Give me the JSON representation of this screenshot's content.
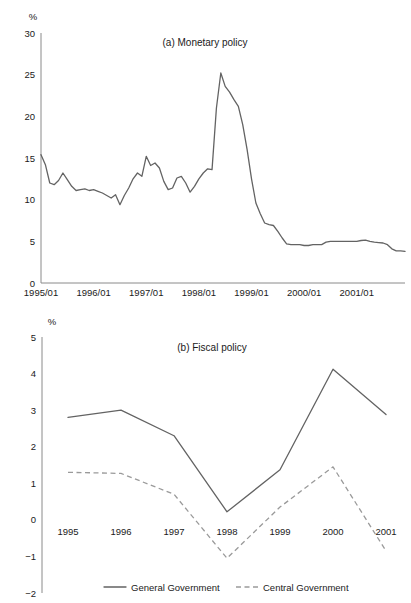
{
  "figure": {
    "unit_label": "%"
  },
  "chart_data": [
    {
      "type": "line",
      "panel_id": "a",
      "title": "(a) Monetary policy",
      "xlabel": "",
      "ylabel": "%",
      "ylim": [
        0,
        30
      ],
      "yticks": [
        0,
        5,
        10,
        15,
        20,
        25,
        30
      ],
      "ytick_labels": [
        "0",
        "5",
        "10",
        "15",
        "20",
        "25",
        "30"
      ],
      "xtick_labels": [
        "1995/01",
        "1996/01",
        "1997/01",
        "1998/01",
        "1999/01",
        "2000/01",
        "2001/01"
      ],
      "xtick_positions": [
        0,
        12,
        24,
        36,
        48,
        60,
        72
      ],
      "xlim": [
        0,
        83
      ],
      "grid": false,
      "legend": "none",
      "series": [
        {
          "name": "Interest rate",
          "style": "solid",
          "color": "#636363",
          "x": [
            0,
            1,
            2,
            3,
            4,
            5,
            6,
            7,
            8,
            9,
            10,
            11,
            12,
            13,
            14,
            15,
            16,
            17,
            18,
            19,
            20,
            21,
            22,
            23,
            24,
            25,
            26,
            27,
            28,
            29,
            30,
            31,
            32,
            33,
            34,
            35,
            36,
            37,
            38,
            39,
            40,
            41,
            42,
            43,
            44,
            45,
            46,
            47,
            48,
            49,
            50,
            51,
            52,
            53,
            54,
            55,
            56,
            57,
            58,
            59,
            60,
            61,
            62,
            63,
            64,
            65,
            66,
            67,
            68,
            69,
            70,
            71,
            72,
            73,
            74,
            75,
            76,
            77,
            78,
            79,
            80,
            81,
            82,
            83
          ],
          "values": [
            15.4,
            14.2,
            12.0,
            11.8,
            12.3,
            13.2,
            12.4,
            11.6,
            11.1,
            11.2,
            11.3,
            11.1,
            11.2,
            11.0,
            10.8,
            10.5,
            10.2,
            10.6,
            9.4,
            10.5,
            11.4,
            12.5,
            13.2,
            12.8,
            15.2,
            14.1,
            14.4,
            13.8,
            12.2,
            11.2,
            11.4,
            12.6,
            12.8,
            12.0,
            10.9,
            11.6,
            12.5,
            13.2,
            13.7,
            13.6,
            21.0,
            25.2,
            23.6,
            22.9,
            22.0,
            21.2,
            19.0,
            16.0,
            12.5,
            9.6,
            8.3,
            7.2,
            7.0,
            6.9,
            6.2,
            5.4,
            4.7,
            4.6,
            4.6,
            4.6,
            4.5,
            4.5,
            4.6,
            4.6,
            4.6,
            4.9,
            5.0,
            5.0,
            5.0,
            5.0,
            5.0,
            5.0,
            5.0,
            5.1,
            5.15,
            5.0,
            4.9,
            4.85,
            4.8,
            4.6,
            4.1,
            3.85,
            3.85,
            3.8
          ]
        }
      ]
    },
    {
      "type": "line",
      "panel_id": "b",
      "title": "(b) Fiscal policy",
      "xlabel": "",
      "ylabel": "%",
      "ylim": [
        -2,
        5
      ],
      "yticks": [
        -2,
        -1,
        0,
        1,
        2,
        3,
        4,
        5
      ],
      "ytick_labels": [
        "−2",
        "−1",
        "0",
        "1",
        "2",
        "3",
        "4",
        "5"
      ],
      "xtick_labels": [
        "1995",
        "1996",
        "1997",
        "1998",
        "1999",
        "2000",
        "2001"
      ],
      "categories": [
        "1995",
        "1996",
        "1997",
        "1998",
        "1999",
        "2000",
        "2001"
      ],
      "grid": false,
      "legend": "bottom",
      "series": [
        {
          "name": "General Government",
          "style": "solid",
          "color": "#636363",
          "values": [
            2.8,
            3.0,
            2.3,
            0.22,
            1.37,
            4.12,
            2.88
          ]
        },
        {
          "name": "Central Government",
          "style": "dashed",
          "color": "#9a9a9a",
          "values": [
            1.3,
            1.27,
            0.7,
            -1.05,
            0.35,
            1.45,
            -0.85
          ]
        }
      ]
    }
  ],
  "legend": {
    "items": [
      {
        "label": "General Government",
        "style": "solid"
      },
      {
        "label": "Central Government",
        "style": "dashed"
      }
    ]
  }
}
